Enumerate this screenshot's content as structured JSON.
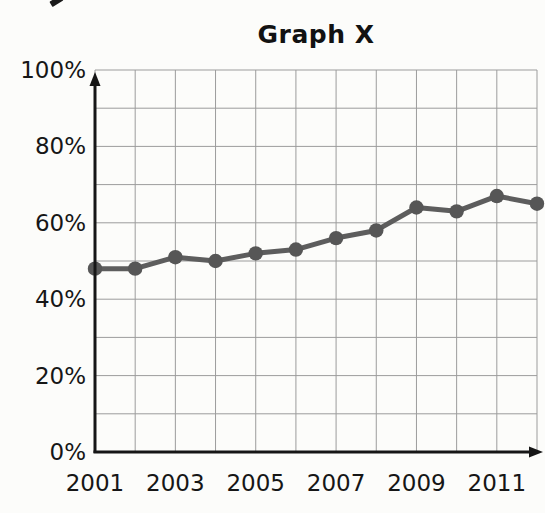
{
  "chart_data": {
    "type": "line",
    "title": "Graph X",
    "categories": [
      "2001",
      "2002",
      "2003",
      "2004",
      "2005",
      "2006",
      "2007",
      "2008",
      "2009",
      "2010",
      "2011",
      "2012"
    ],
    "values": [
      48,
      48,
      51,
      50,
      52,
      53,
      56,
      58,
      64,
      63,
      67,
      65
    ],
    "xlabel": "",
    "ylabel": "",
    "ylim": [
      0,
      100
    ],
    "y_gridline_step": 10,
    "y_label_step": 20,
    "ytick_labels": [
      "0%",
      "20%",
      "40%",
      "60%",
      "80%",
      "100%"
    ],
    "xtick_labels": [
      "2001",
      "2003",
      "2005",
      "2007",
      "2009",
      "2011"
    ],
    "xtick_positions": [
      0,
      2,
      4,
      6,
      8,
      10
    ],
    "grid": "on",
    "legend": "none",
    "marker": "filled-circle",
    "colors": {
      "line": "#5d5d5d",
      "marker": "#565656",
      "grid": "#9c9c9c",
      "axis": "#161616",
      "text": "#161616",
      "background": "#fcfcfa"
    }
  }
}
